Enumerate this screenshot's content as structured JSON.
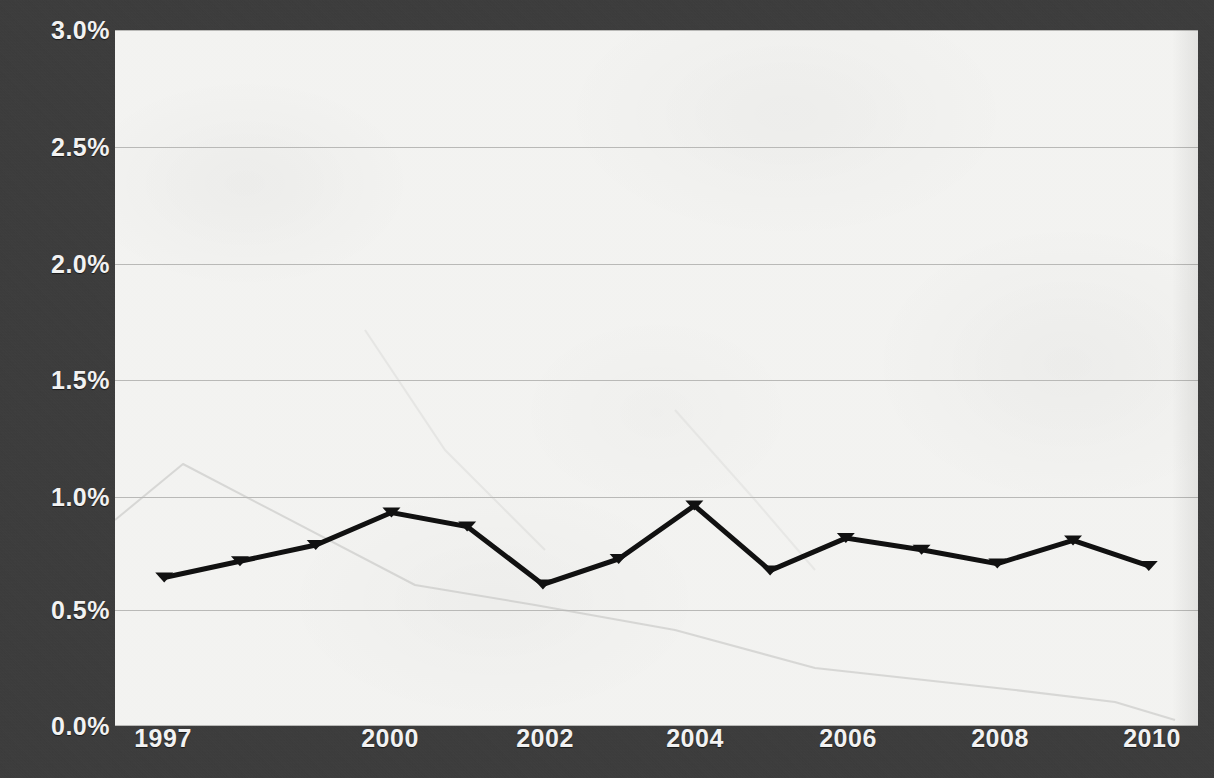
{
  "chart_data": {
    "type": "line",
    "title": "",
    "subtitle": "",
    "xlabel": "",
    "ylabel": "",
    "grid": true,
    "legend_position": "none",
    "background_color": "#3b3b3b",
    "plot_background_color": "#f4f4f2",
    "series_color": "#111111",
    "gridline_color": "#b9b9b7",
    "tick_label_color": "#f2f2f2",
    "x": [
      1997,
      1998,
      1999,
      2000,
      2001,
      2002,
      2003,
      2004,
      2005,
      2006,
      2007,
      2008,
      2009,
      2010
    ],
    "xlim": [
      1996.35,
      2010.65
    ],
    "ylim": [
      0.0,
      3.0
    ],
    "yticks": [
      0.0,
      0.5,
      1.0,
      1.5,
      2.0,
      2.5,
      3.0
    ],
    "ytick_labels": [
      "0.0%",
      "0.5%",
      "1.0%",
      "1.5%",
      "2.0%",
      "2.5%",
      "3.0%"
    ],
    "xticks": [
      1997,
      2000,
      2002,
      2004,
      2006,
      2008,
      2010
    ],
    "xtick_labels": [
      "1997",
      "2000",
      "2002",
      "2004",
      "2006",
      "2008",
      "2010"
    ],
    "series": [
      {
        "name": "series-1",
        "marker": "triangle-down",
        "values": [
          0.64,
          0.71,
          0.78,
          0.92,
          0.86,
          0.61,
          0.72,
          0.95,
          0.67,
          0.81,
          0.76,
          0.7,
          0.8,
          0.69
        ]
      }
    ]
  },
  "axes": {
    "y_labels": [
      "3.0%",
      "2.5%",
      "2.0%",
      "1.5%",
      "1.0%",
      "0.5%",
      "0.0%"
    ],
    "x_labels": [
      "1997",
      "2000",
      "2002",
      "2004",
      "2006",
      "2008",
      "2010"
    ]
  }
}
